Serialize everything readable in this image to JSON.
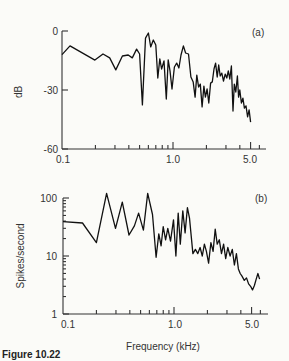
{
  "figure": {
    "caption": "Figure 10.22",
    "xlabel": "Frequency (kHz)"
  },
  "chart_data": [
    {
      "type": "line",
      "panel": "(a)",
      "title": "",
      "xlabel": "",
      "ylabel": "dB",
      "xscale": "log",
      "xlim": [
        0.1,
        6.5
      ],
      "ylim": [
        -60,
        0
      ],
      "xticks": [
        "0.1",
        "1.0",
        "5.0"
      ],
      "yticks": [
        "0",
        "-30",
        "-60"
      ],
      "grid": false,
      "series": [
        {
          "name": "spectrum",
          "points": [
            [
              0.1,
              -12
            ],
            [
              0.118,
              -7.6
            ],
            [
              0.198,
              -14.8
            ],
            [
              0.234,
              -11.7
            ],
            [
              0.269,
              -13.7
            ],
            [
              0.305,
              -19.8
            ],
            [
              0.35,
              -12.7
            ],
            [
              0.395,
              -12.2
            ],
            [
              0.43,
              -13.7
            ],
            [
              0.47,
              -9.2
            ],
            [
              0.5,
              -11.7
            ],
            [
              0.53,
              -37.6
            ],
            [
              0.565,
              -3.6
            ],
            [
              0.6,
              -1.0
            ],
            [
              0.63,
              -8.1
            ],
            [
              0.665,
              -4.6
            ],
            [
              0.7,
              -7.1
            ],
            [
              0.73,
              -23.9
            ],
            [
              0.76,
              -14.2
            ],
            [
              0.79,
              -19.3
            ],
            [
              0.83,
              -15.2
            ],
            [
              0.87,
              -34.6
            ],
            [
              0.905,
              -14.7
            ],
            [
              0.94,
              -20.3
            ],
            [
              0.98,
              -29.5
            ],
            [
              1.03,
              -18.3
            ],
            [
              1.08,
              -16.3
            ],
            [
              1.13,
              -18.8
            ],
            [
              1.18,
              -12.2
            ],
            [
              1.24,
              -7.6
            ],
            [
              1.3,
              -11.2
            ],
            [
              1.38,
              -11.7
            ],
            [
              1.45,
              -23.4
            ],
            [
              1.52,
              -26.0
            ],
            [
              1.58,
              -33.6
            ],
            [
              1.64,
              -22.4
            ],
            [
              1.7,
              -28.5
            ],
            [
              1.76,
              -27.0
            ],
            [
              1.83,
              -38.6
            ],
            [
              1.9,
              -28.0
            ],
            [
              1.96,
              -33.6
            ],
            [
              2.03,
              -29.5
            ],
            [
              2.1,
              -36.6
            ],
            [
              2.18,
              -26.5
            ],
            [
              2.26,
              -25.9
            ],
            [
              2.34,
              -19.3
            ],
            [
              2.42,
              -16.3
            ],
            [
              2.5,
              -23.4
            ],
            [
              2.58,
              -17.3
            ],
            [
              2.66,
              -22.9
            ],
            [
              2.75,
              -21.4
            ],
            [
              2.85,
              -25.4
            ],
            [
              2.95,
              -21.9
            ],
            [
              3.05,
              -23.9
            ],
            [
              3.15,
              -20.3
            ],
            [
              3.25,
              -24.4
            ],
            [
              3.36,
              -17.8
            ],
            [
              3.47,
              -40.7
            ],
            [
              3.57,
              -27.0
            ],
            [
              3.68,
              -31.0
            ],
            [
              3.8,
              -22.9
            ],
            [
              3.9,
              -33.6
            ],
            [
              4.0,
              -30.0
            ],
            [
              4.13,
              -36.6
            ],
            [
              4.26,
              -34.1
            ],
            [
              4.4,
              -39.2
            ],
            [
              4.55,
              -38.1
            ],
            [
              4.7,
              -43.7
            ],
            [
              4.85,
              -40.1
            ],
            [
              5.0,
              -46.3
            ]
          ]
        }
      ]
    },
    {
      "type": "line",
      "panel": "(b)",
      "title": "",
      "xlabel": "Frequency (kHz)",
      "ylabel": "Spikes/second",
      "xscale": "log",
      "yscale": "log",
      "xlim": [
        0.1,
        6.5
      ],
      "ylim": [
        1,
        100
      ],
      "xticks": [
        "0.1",
        "1.0",
        "5.0"
      ],
      "yticks": [
        "100",
        "10",
        "1"
      ],
      "grid": false,
      "series": [
        {
          "name": "spike_rate",
          "points": [
            [
              0.1,
              39
            ],
            [
              0.15,
              37
            ],
            [
              0.2,
              17
            ],
            [
              0.247,
              120
            ],
            [
              0.297,
              30
            ],
            [
              0.342,
              85
            ],
            [
              0.393,
              23
            ],
            [
              0.44,
              33
            ],
            [
              0.48,
              55
            ],
            [
              0.53,
              28
            ],
            [
              0.58,
              120
            ],
            [
              0.64,
              52
            ],
            [
              0.69,
              9.5
            ],
            [
              0.73,
              24
            ],
            [
              0.765,
              15
            ],
            [
              0.8,
              32
            ],
            [
              0.84,
              19
            ],
            [
              0.88,
              30
            ],
            [
              0.93,
              18
            ],
            [
              0.99,
              42
            ],
            [
              1.04,
              10
            ],
            [
              1.09,
              55
            ],
            [
              1.14,
              16
            ],
            [
              1.2,
              60
            ],
            [
              1.26,
              25
            ],
            [
              1.32,
              68
            ],
            [
              1.38,
              45
            ],
            [
              1.48,
              11
            ],
            [
              1.56,
              13
            ],
            [
              1.64,
              11
            ],
            [
              1.72,
              14
            ],
            [
              1.8,
              10
            ],
            [
              1.88,
              16
            ],
            [
              1.96,
              12
            ],
            [
              2.05,
              7.5
            ],
            [
              2.15,
              17
            ],
            [
              2.25,
              12
            ],
            [
              2.35,
              29
            ],
            [
              2.45,
              16
            ],
            [
              2.56,
              19
            ],
            [
              2.68,
              11
            ],
            [
              2.8,
              16
            ],
            [
              2.92,
              9
            ],
            [
              3.05,
              14
            ],
            [
              3.2,
              10
            ],
            [
              3.35,
              13
            ],
            [
              3.5,
              7
            ],
            [
              3.65,
              11
            ],
            [
              3.8,
              6
            ],
            [
              3.95,
              5
            ],
            [
              4.1,
              4.5
            ],
            [
              4.3,
              3.8
            ],
            [
              4.5,
              4.2
            ],
            [
              4.7,
              3.3
            ],
            [
              4.9,
              3.0
            ],
            [
              5.1,
              2.6
            ],
            [
              5.3,
              3.1
            ],
            [
              5.5,
              4.0
            ],
            [
              5.7,
              5.0
            ],
            [
              5.9,
              4.0
            ]
          ]
        }
      ]
    }
  ]
}
